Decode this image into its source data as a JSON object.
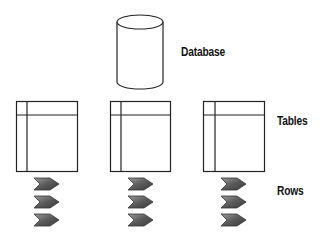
{
  "labels": {
    "database": "Database",
    "tables": "Tables",
    "rows": "Rows"
  },
  "diagram": {
    "database": {
      "shape": "cylinder",
      "label": "Database"
    },
    "tables": [
      {
        "id": 1,
        "rows": 3
      },
      {
        "id": 2,
        "rows": 3
      },
      {
        "id": 3,
        "rows": 3
      }
    ],
    "colors": {
      "stroke": "#222222",
      "row_fill_dark": "#555555",
      "row_fill_light": "#bbbbbb"
    }
  }
}
